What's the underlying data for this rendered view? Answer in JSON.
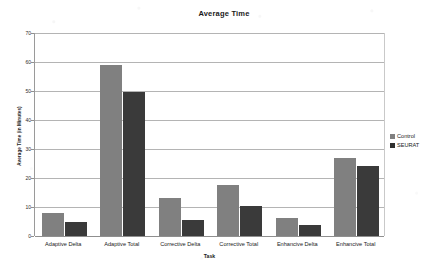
{
  "chart_data": {
    "type": "bar",
    "title": "Average Time",
    "xlabel": "Task",
    "ylabel": "Average Time (in Minutes)",
    "categories": [
      "Adaptive Delta",
      "Adaptive Total",
      "Corrective Delta",
      "Corrective Total",
      "Enhancive Delta",
      "Enhancive Total"
    ],
    "series": [
      {
        "name": "Control",
        "color": "#808080",
        "values": [
          7.8,
          59,
          13,
          17.5,
          6.3,
          27
        ]
      },
      {
        "name": "SEURAT",
        "color": "#3a3a3a",
        "values": [
          4.7,
          49.5,
          5.5,
          10.5,
          3.7,
          24
        ]
      }
    ],
    "ylim": [
      0,
      70
    ],
    "yticks": [
      0,
      10,
      20,
      30,
      40,
      50,
      60,
      70
    ],
    "ytick_labels": [
      "0",
      "10",
      "20",
      "30",
      "40",
      "50",
      "60",
      "70"
    ],
    "grid": "horizontal",
    "legend_position": "right"
  },
  "legend": {
    "entries": [
      {
        "label": "Control"
      },
      {
        "label": "SEURAT"
      }
    ]
  }
}
